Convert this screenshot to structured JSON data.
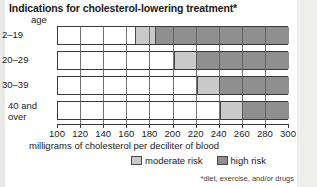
{
  "title": "Indications for cholesterol-lowering treatment*",
  "footnote": "*diet, exercise, and/or drugs",
  "axis": {
    "y_header": "age",
    "x_title": "milligrams of cholesterol per deciliter of blood"
  },
  "legend": {
    "moderate_label": "moderate risk",
    "high_label": "high risk"
  },
  "colors": {
    "low": "#ffffff",
    "moderate": "#c9c9c9",
    "high": "#8f8f8f",
    "outline": "#3a3a3a"
  },
  "chart_data": {
    "type": "bar",
    "orientation": "horizontal",
    "title": "Indications for cholesterol-lowering treatment*",
    "xlabel": "milligrams of cholesterol per deciliter of blood",
    "ylabel": "age",
    "xlim": [
      100,
      300
    ],
    "xticks": [
      100,
      120,
      140,
      160,
      180,
      200,
      220,
      240,
      260,
      280,
      300
    ],
    "xtick_labels": [
      "100",
      "120",
      "140",
      "160",
      "180",
      "200",
      "220",
      "240",
      "260",
      "280",
      "300"
    ],
    "grid": true,
    "grid_axis": "x",
    "legend": [
      "moderate risk",
      "high risk"
    ],
    "legend_position": "bottom-center",
    "categories": [
      "2–19",
      "20–29",
      "30–39",
      "40 and over"
    ],
    "stacked_ranges": [
      {
        "category": "2–19",
        "low": [
          100,
          167
        ],
        "moderate": [
          167,
          185
        ],
        "high": [
          185,
          300
        ]
      },
      {
        "category": "20–29",
        "low": [
          100,
          200
        ],
        "moderate": [
          200,
          220
        ],
        "high": [
          220,
          300
        ]
      },
      {
        "category": "30–39",
        "low": [
          100,
          220
        ],
        "moderate": [
          220,
          240
        ],
        "high": [
          240,
          300
        ]
      },
      {
        "category": "40 and over",
        "low": [
          100,
          240
        ],
        "moderate": [
          240,
          260
        ],
        "high": [
          260,
          300
        ]
      }
    ],
    "series": [
      {
        "name": "moderate risk threshold",
        "values": [
          167,
          200,
          220,
          240
        ]
      },
      {
        "name": "high risk threshold",
        "values": [
          185,
          220,
          240,
          260
        ]
      }
    ]
  }
}
